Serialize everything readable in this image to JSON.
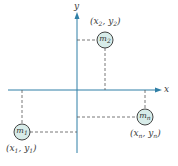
{
  "diagram": {
    "axes": {
      "x_label": "x",
      "y_label": "y",
      "color": "#2f7fa6"
    },
    "masses": [
      {
        "name": "m",
        "sub": "1",
        "coord_x": "x",
        "coord_x_sub": "1",
        "coord_y": "y",
        "coord_y_sub": "1"
      },
      {
        "name": "m",
        "sub": "2",
        "coord_x": "x",
        "coord_x_sub": "2",
        "coord_y": "y",
        "coord_y_sub": "2"
      },
      {
        "name": "m",
        "sub": "n",
        "coord_x": "x",
        "coord_x_sub": "n",
        "coord_y": "y",
        "coord_y_sub": "n"
      }
    ],
    "colors": {
      "mass_fill": "#d8ece9",
      "mass_stroke": "#444444",
      "dash": "#555555"
    }
  }
}
